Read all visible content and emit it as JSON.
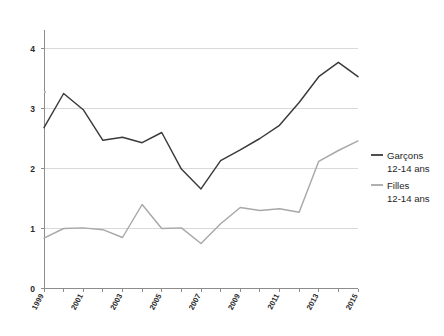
{
  "chart_data": {
    "type": "line",
    "title": "",
    "subtitle": "",
    "xlabel": "",
    "ylabel": "",
    "x": [
      1999,
      2000,
      2001,
      2002,
      2003,
      2004,
      2005,
      2006,
      2007,
      2008,
      2009,
      2010,
      2011,
      2012,
      2013,
      2014,
      2015
    ],
    "categories": [
      "1999",
      "2000",
      "2001",
      "2002",
      "2003",
      "2004",
      "2005",
      "2006",
      "2007",
      "2008",
      "2009",
      "2010",
      "2011",
      "2012",
      "2013",
      "2014",
      "2015"
    ],
    "xtick_labels": [
      "1999",
      "2001",
      "2003",
      "2005",
      "2007",
      "2009",
      "2011",
      "2013",
      "2015"
    ],
    "xtick_values": [
      1999,
      2001,
      2003,
      2005,
      2007,
      2009,
      2011,
      2013,
      2015
    ],
    "ytick_labels": [
      "0",
      "1",
      "2",
      "3",
      "4"
    ],
    "ytick_values": [
      0,
      1,
      2,
      3,
      4
    ],
    "ylim": [
      0,
      4.35
    ],
    "xlim": [
      1999,
      2015
    ],
    "grid": true,
    "grid_axis": "y",
    "legend_position": "right",
    "series": [
      {
        "name": "Garçons",
        "label_line1": "Garçons",
        "label_line2": "12-14 ans",
        "color": "#3a3a3a",
        "values": [
          2.68,
          3.25,
          2.98,
          2.47,
          2.52,
          2.43,
          2.6,
          1.99,
          1.66,
          2.13,
          2.31,
          2.5,
          2.72,
          3.1,
          3.53,
          3.77,
          3.53
        ]
      },
      {
        "name": "Filles",
        "label_line1": "Filles",
        "label_line2": "12-14 ans",
        "color": "#a8a8a8",
        "values": [
          0.84,
          1.0,
          1.01,
          0.98,
          0.85,
          1.4,
          1.0,
          1.01,
          0.75,
          1.08,
          1.35,
          1.3,
          1.33,
          1.27,
          2.12,
          2.3,
          2.46
        ]
      }
    ]
  },
  "legend": {
    "entries": [
      {
        "line1": "Garçons",
        "line2": "12-14 ans",
        "color": "#3a3a3a"
      },
      {
        "line1": "Filles",
        "line2": "12-14 ans",
        "color": "#a8a8a8"
      }
    ]
  },
  "axes": {
    "y_labels": [
      "4",
      "3",
      "2",
      "1",
      "0"
    ],
    "x_labels": [
      "1999",
      "2001",
      "2003",
      "2005",
      "2007",
      "2009",
      "2011",
      "2013",
      "2015"
    ]
  }
}
